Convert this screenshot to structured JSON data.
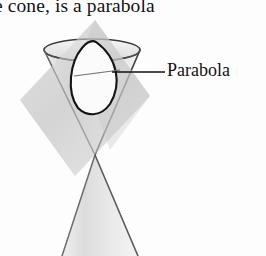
{
  "figure": {
    "caption_fragment": "e cone, is a parabola",
    "label": "Parabola",
    "diagram_type": "conic-section-double-cone",
    "shapes": {
      "upper_nappe_name": "upper-cone",
      "lower_nappe_name": "lower-cone",
      "cutting_plane_name": "cutting-plane",
      "section_curve_name": "parabola-section",
      "rim_ellipse_name": "cone-rim-ellipse",
      "leader_line_name": "leader-line"
    },
    "colors": {
      "background": "#fdfdfd",
      "outline": "#1a1a1a",
      "cone_outline": "#55555a",
      "cone_fill_light": "#ececec",
      "cone_fill_mid": "#d8d8d8",
      "plane_fill": "#d2d2d2",
      "plane_fill_dark": "#bfbfbf",
      "section_fill": "#fbfbfb",
      "text": "#131313"
    },
    "geometry": {
      "apex_x": 95,
      "apex_y": 155,
      "rim_center_x": 92,
      "rim_center_y": 50,
      "rim_radius_x": 48,
      "rim_radius_y": 11,
      "lower_base_left_x": 62,
      "lower_base_right_x": 138,
      "lower_base_y": 256,
      "leader_line_start_x": 112,
      "leader_line_end_x": 165,
      "leader_line_y": 72,
      "section_top_x": 96,
      "section_top_y": 42,
      "section_bottom_x": 80,
      "section_bottom_y": 112
    }
  }
}
